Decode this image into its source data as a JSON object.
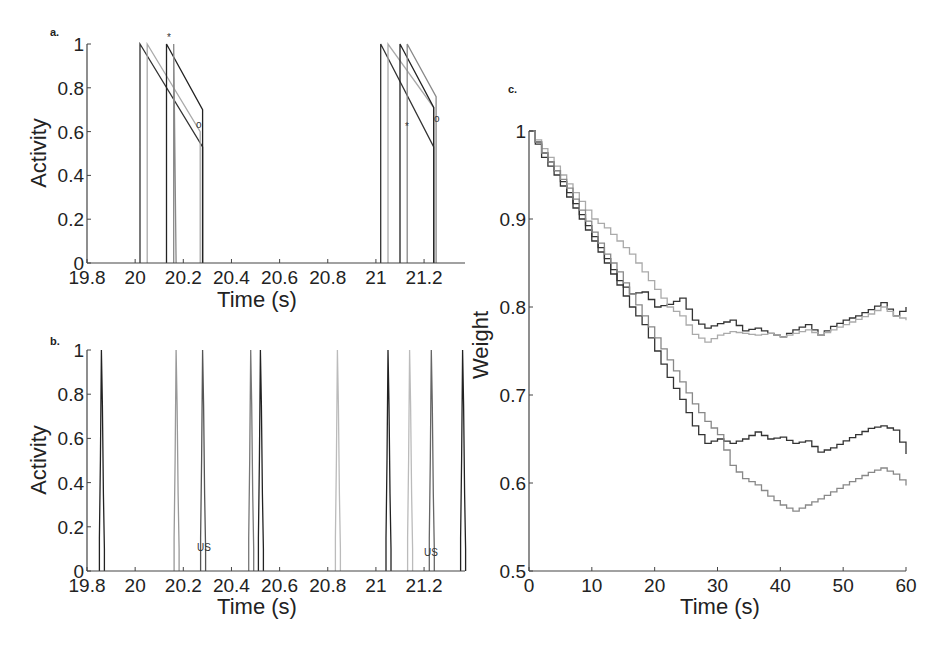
{
  "chart_data": [
    {
      "panel": "a.",
      "type": "line",
      "xlabel": "Time (s)",
      "ylabel": "Activity",
      "xlim": [
        19.8,
        21.37
      ],
      "ylim": [
        0,
        1
      ],
      "xticks": [
        "19.8",
        "20",
        "20.2",
        "20.4",
        "20.6",
        "20.8",
        "21",
        "21.2"
      ],
      "yticks": [
        "0",
        "0.2",
        "0.4",
        "0.6",
        "0.8",
        "1"
      ],
      "annotations": [
        {
          "text": "*",
          "x": 20.19,
          "y": 1.02
        },
        {
          "text": "o",
          "x": 20.3,
          "y": 0.77
        },
        {
          "text": "*",
          "x": 21.15,
          "y": 0.74
        },
        {
          "text": "o",
          "x": 21.25,
          "y": 0.79
        }
      ],
      "series": [
        {
          "name": "unit-1",
          "color": "#333333",
          "segments": [
            [
              [
                20.02,
                0
              ],
              [
                20.02,
                1
              ],
              [
                20.28,
                0.53
              ],
              [
                20.28,
                0
              ]
            ],
            [
              [
                21.02,
                0
              ],
              [
                21.02,
                1
              ],
              [
                21.24,
                0.53
              ],
              [
                21.24,
                0
              ]
            ]
          ]
        },
        {
          "name": "unit-2",
          "color": "#aaaaaa",
          "segments": [
            [
              [
                20.05,
                0
              ],
              [
                20.05,
                1
              ],
              [
                20.27,
                0.6
              ],
              [
                20.27,
                0
              ]
            ],
            [
              [
                21.05,
                0
              ],
              [
                21.05,
                1
              ],
              [
                21.24,
                0.71
              ],
              [
                21.24,
                0
              ]
            ]
          ]
        },
        {
          "name": "unit-3",
          "color": "#222222",
          "segments": [
            [
              [
                20.13,
                0
              ],
              [
                20.13,
                1
              ],
              [
                20.28,
                0.7
              ],
              [
                20.28,
                0
              ]
            ],
            [
              [
                21.1,
                0
              ],
              [
                21.1,
                1
              ],
              [
                21.24,
                0.71
              ],
              [
                21.24,
                0
              ]
            ]
          ]
        },
        {
          "name": "unit-4",
          "color": "#888888",
          "segments": [
            [
              [
                20.16,
                0
              ],
              [
                20.16,
                1
              ],
              [
                20.17,
                0
              ]
            ],
            [
              [
                21.13,
                0
              ],
              [
                21.13,
                1
              ],
              [
                21.25,
                0.76
              ],
              [
                21.25,
                0
              ]
            ]
          ]
        }
      ]
    },
    {
      "panel": "b.",
      "type": "line",
      "xlabel": "Time (s)",
      "ylabel": "Activity",
      "xlim": [
        19.8,
        21.37
      ],
      "ylim": [
        0,
        1
      ],
      "xticks": [
        "19.8",
        "20",
        "20.2",
        "20.4",
        "20.6",
        "20.8",
        "21",
        "21.2"
      ],
      "yticks": [
        "0",
        "0.2",
        "0.4",
        "0.6",
        "0.8",
        "1"
      ],
      "annotations": [
        {
          "text": "US",
          "x": 20.3,
          "y": 0.1
        },
        {
          "text": "US",
          "x": 21.25,
          "y": 0.08
        }
      ],
      "spikes": [
        {
          "t": 19.86,
          "peak": 1.0,
          "color": "#222222"
        },
        {
          "t": 20.17,
          "peak": 1.0,
          "color": "#999999"
        },
        {
          "t": 20.28,
          "peak": 1.0,
          "color": "#555555"
        },
        {
          "t": 20.48,
          "peak": 1.0,
          "color": "#777777"
        },
        {
          "t": 20.52,
          "peak": 1.0,
          "color": "#222222"
        },
        {
          "t": 20.84,
          "peak": 1.0,
          "color": "#bbbbbb"
        },
        {
          "t": 21.05,
          "peak": 1.0,
          "color": "#222222"
        },
        {
          "t": 21.14,
          "peak": 1.0,
          "color": "#bbbbbb"
        },
        {
          "t": 21.23,
          "peak": 1.0,
          "color": "#666666"
        },
        {
          "t": 21.36,
          "peak": 1.0,
          "color": "#222222"
        }
      ]
    },
    {
      "panel": "c.",
      "type": "line",
      "xlabel": "Time (s)",
      "ylabel": "Weight",
      "xlim": [
        0,
        60
      ],
      "ylim": [
        0.5,
        1
      ],
      "xticks": [
        "0",
        "10",
        "20",
        "30",
        "40",
        "50",
        "60"
      ],
      "yticks": [
        "0.5",
        "0.6",
        "0.7",
        "0.8",
        "0.9",
        "1"
      ],
      "series": [
        {
          "name": "dark-upper",
          "color": "#333333",
          "x": [
            0,
            2,
            4,
            6,
            8,
            10,
            12,
            14,
            16,
            18,
            20,
            22,
            24,
            26,
            28,
            30,
            32,
            34,
            36,
            38,
            40,
            42,
            44,
            46,
            48,
            50,
            52,
            54,
            56,
            58,
            60
          ],
          "y": [
            1.0,
            0.975,
            0.955,
            0.93,
            0.905,
            0.88,
            0.855,
            0.83,
            0.815,
            0.817,
            0.8,
            0.803,
            0.81,
            0.785,
            0.776,
            0.781,
            0.785,
            0.773,
            0.776,
            0.77,
            0.766,
            0.774,
            0.78,
            0.768,
            0.778,
            0.785,
            0.79,
            0.797,
            0.805,
            0.79,
            0.8
          ]
        },
        {
          "name": "light-upper",
          "color": "#aaaaaa",
          "x": [
            0,
            2,
            4,
            6,
            8,
            10,
            12,
            14,
            16,
            18,
            20,
            22,
            24,
            26,
            28,
            30,
            32,
            34,
            36,
            38,
            40,
            42,
            44,
            46,
            48,
            50,
            52,
            54,
            56,
            58,
            60
          ],
          "y": [
            1.0,
            0.98,
            0.96,
            0.94,
            0.92,
            0.9,
            0.89,
            0.875,
            0.86,
            0.84,
            0.82,
            0.8,
            0.79,
            0.769,
            0.76,
            0.768,
            0.772,
            0.77,
            0.768,
            0.77,
            0.766,
            0.77,
            0.774,
            0.768,
            0.774,
            0.78,
            0.786,
            0.792,
            0.8,
            0.79,
            0.785
          ]
        },
        {
          "name": "dark-lower",
          "color": "#333333",
          "x": [
            0,
            2,
            4,
            6,
            8,
            10,
            12,
            14,
            16,
            18,
            20,
            22,
            24,
            26,
            28,
            30,
            32,
            34,
            36,
            38,
            40,
            42,
            44,
            46,
            48,
            50,
            52,
            54,
            56,
            58,
            60
          ],
          "y": [
            1.0,
            0.97,
            0.95,
            0.925,
            0.9,
            0.875,
            0.85,
            0.825,
            0.8,
            0.78,
            0.75,
            0.72,
            0.695,
            0.665,
            0.645,
            0.65,
            0.645,
            0.65,
            0.658,
            0.65,
            0.652,
            0.645,
            0.648,
            0.635,
            0.64,
            0.648,
            0.655,
            0.662,
            0.665,
            0.66,
            0.633
          ]
        },
        {
          "name": "light-lower",
          "color": "#888888",
          "x": [
            0,
            2,
            4,
            6,
            8,
            10,
            12,
            14,
            16,
            18,
            20,
            22,
            24,
            26,
            28,
            30,
            32,
            34,
            36,
            38,
            40,
            42,
            44,
            46,
            48,
            50,
            52,
            54,
            56,
            58,
            60
          ],
          "y": [
            1.0,
            0.975,
            0.955,
            0.935,
            0.91,
            0.885,
            0.86,
            0.84,
            0.815,
            0.79,
            0.765,
            0.74,
            0.715,
            0.69,
            0.67,
            0.655,
            0.62,
            0.605,
            0.598,
            0.585,
            0.575,
            0.568,
            0.575,
            0.582,
            0.59,
            0.598,
            0.605,
            0.612,
            0.617,
            0.61,
            0.597
          ]
        }
      ]
    }
  ],
  "panels": {
    "a": {
      "label": "a.",
      "xlabel": "Time (s)",
      "ylabel": "Activity",
      "ann_star1": "*",
      "ann_o1": "o",
      "ann_star2": "*",
      "ann_o2": "o"
    },
    "b": {
      "label": "b.",
      "xlabel": "Time (s)",
      "ylabel": "Activity",
      "ann_us1": "US",
      "ann_us2": "US"
    },
    "c": {
      "label": "c.",
      "xlabel": "Time (s)",
      "ylabel": "Weight"
    }
  }
}
